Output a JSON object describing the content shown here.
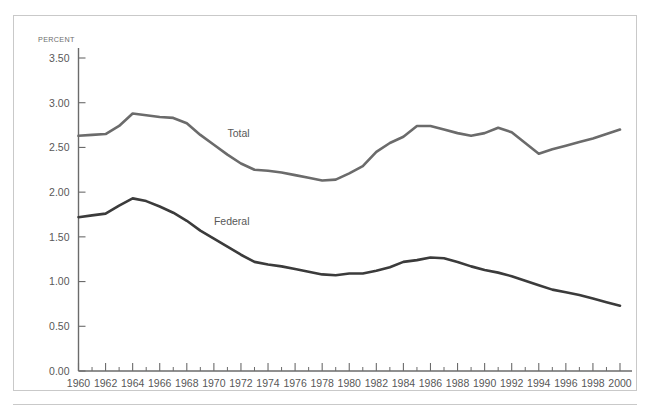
{
  "figure": {
    "unit_label": "PERCENT",
    "background_color": "#ffffff",
    "frame_color": "#c9c9c9",
    "axis_color": "#6b6b6b",
    "text_color": "#585858"
  },
  "chart_data": {
    "type": "line",
    "title": "",
    "subtitle": "",
    "xlabel": "",
    "ylabel": "PERCENT",
    "xlim": [
      1960,
      2000
    ],
    "ylim": [
      0.0,
      3.5
    ],
    "ytick_labels": [
      "0.00",
      "0.50",
      "1.00",
      "1.50",
      "2.00",
      "2.50",
      "3.00",
      "3.50"
    ],
    "ytick_values": [
      0.0,
      0.5,
      1.0,
      1.5,
      2.0,
      2.5,
      3.0,
      3.5
    ],
    "xtick_labels": [
      "1960",
      "1962",
      "1964",
      "1966",
      "1968",
      "1970",
      "1972",
      "1974",
      "1976",
      "1978",
      "1980",
      "1982",
      "1984",
      "1986",
      "1988",
      "1990",
      "1992",
      "1994",
      "1996",
      "1998",
      "2000"
    ],
    "xtick_values": [
      1960,
      1962,
      1964,
      1966,
      1968,
      1970,
      1972,
      1974,
      1976,
      1978,
      1980,
      1982,
      1984,
      1986,
      1988,
      1990,
      1992,
      1994,
      1996,
      1998,
      2000
    ],
    "minor_xticks": [
      1961,
      1963,
      1965,
      1967,
      1969,
      1971,
      1973,
      1975,
      1977,
      1979,
      1981,
      1983,
      1985,
      1987,
      1989,
      1991,
      1993,
      1995,
      1997,
      1999
    ],
    "grid": false,
    "legend_position": "inline-annotation",
    "x": [
      1960,
      1961,
      1962,
      1963,
      1964,
      1965,
      1966,
      1967,
      1968,
      1969,
      1970,
      1971,
      1972,
      1973,
      1974,
      1975,
      1976,
      1977,
      1978,
      1979,
      1980,
      1981,
      1982,
      1983,
      1984,
      1985,
      1986,
      1987,
      1988,
      1989,
      1990,
      1991,
      1992,
      1993,
      1994,
      1995,
      1996,
      1997,
      1998,
      1999,
      2000
    ],
    "series": [
      {
        "name": "Total",
        "color": "#6b6b6b",
        "line_width": 2.6,
        "label_x": 1971,
        "label_y": 2.62,
        "values": [
          2.63,
          2.64,
          2.65,
          2.74,
          2.88,
          2.86,
          2.84,
          2.83,
          2.77,
          2.64,
          2.53,
          2.42,
          2.32,
          2.25,
          2.24,
          2.22,
          2.19,
          2.16,
          2.13,
          2.14,
          2.21,
          2.29,
          2.45,
          2.55,
          2.62,
          2.74,
          2.74,
          2.7,
          2.66,
          2.63,
          2.66,
          2.72,
          2.67,
          2.55,
          2.43,
          2.48,
          2.52,
          2.56,
          2.6,
          2.65,
          2.7
        ]
      },
      {
        "name": "Federal",
        "color": "#3b3b3b",
        "line_width": 2.6,
        "label_x": 1970,
        "label_y": 1.63,
        "values": [
          1.72,
          1.74,
          1.76,
          1.85,
          1.93,
          1.9,
          1.84,
          1.77,
          1.68,
          1.57,
          1.48,
          1.39,
          1.3,
          1.22,
          1.19,
          1.17,
          1.14,
          1.11,
          1.08,
          1.07,
          1.09,
          1.09,
          1.12,
          1.16,
          1.22,
          1.24,
          1.27,
          1.26,
          1.22,
          1.17,
          1.13,
          1.1,
          1.06,
          1.01,
          0.96,
          0.91,
          0.88,
          0.85,
          0.81,
          0.77,
          0.73
        ]
      }
    ]
  }
}
